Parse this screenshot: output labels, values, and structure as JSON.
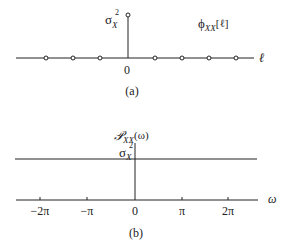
{
  "panel_a": {
    "sigma": "σ",
    "sigma_sup": "2",
    "sigma_sub": "X",
    "func_phi": "ϕ",
    "func_sub": "XX",
    "func_arg": "[ℓ]",
    "axis_var": "ℓ",
    "origin": "0",
    "caption": "(a)"
  },
  "panel_b": {
    "func_P": "𝒫",
    "func_sub": "XX",
    "func_arg": "(ω)",
    "sigma": "σ",
    "sigma_sup": "2",
    "sigma_sub": "X",
    "axis_var": "ω",
    "ticks": [
      "−2π",
      "−π",
      "0",
      "π",
      "2π"
    ],
    "caption": "(b)"
  }
}
